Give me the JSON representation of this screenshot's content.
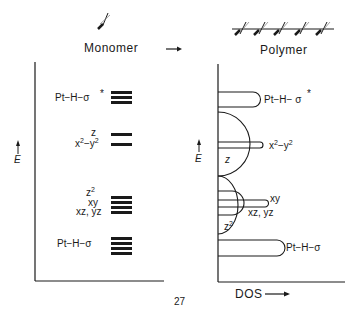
{
  "panels": {
    "monomer": {
      "title": "Monomer",
      "axis_label": "E",
      "levels": [
        {
          "label": "Pt-H-σ*",
          "bars": 3
        },
        {
          "label_top": "z",
          "label": "x²-y²",
          "bars": 2
        },
        {
          "labels": [
            "z²",
            "xy",
            "xz, yz"
          ],
          "bars": 4
        },
        {
          "label": "Pt-H-σ",
          "bars": 4
        }
      ]
    },
    "polymer": {
      "title": "Polymer",
      "axis_label": "E",
      "x_axis_label": "DOS",
      "bands": [
        {
          "label": "Pt-H-σ*"
        },
        {
          "label": "x²-y²"
        },
        {
          "label": "z"
        },
        {
          "label": "xy"
        },
        {
          "label": "xz, yz"
        },
        {
          "label": "z²"
        },
        {
          "label": "Pt-H-σ"
        }
      ]
    }
  },
  "arrow": "→",
  "labels": {
    "mono_sigma_star": "Pt−H−σ",
    "mono_z": "z",
    "mono_x2y2_x": "x",
    "mono_x2y2_y": "−y",
    "mono_sup2": "2",
    "mono_z2": "z",
    "mono_xy": "xy",
    "mono_xzyz": "xz, yz",
    "mono_sigma": "Pt−H−σ",
    "star": "*",
    "poly_sigma_star": "Pt−H− σ",
    "poly_x2y2_x": "x",
    "poly_x2y2_y": "−y",
    "poly_z": "z",
    "poly_xy": "xy",
    "poly_xzyz": "xz, yz",
    "poly_z2": "z",
    "poly_sigma": "Pt−H−σ",
    "E": "E",
    "dos": "DOS",
    "page_number": "27"
  }
}
